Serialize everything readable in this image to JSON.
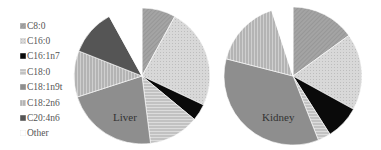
{
  "chart_data": [
    {
      "type": "pie",
      "title": "Liver",
      "categories": [
        "C8:0",
        "C16:0",
        "C16:1n7",
        "C18:0",
        "C18:1n9t",
        "C18:2n6",
        "C20:4n6",
        "Other"
      ],
      "values": [
        8,
        24,
        4,
        12,
        22,
        11,
        11,
        8
      ]
    },
    {
      "type": "pie",
      "title": "Kidney",
      "categories": [
        "C8:0",
        "C16:0",
        "C16:1n7",
        "C18:0",
        "C18:1n9t",
        "C18:2n6",
        "C20:4n6",
        "Other"
      ],
      "values": [
        15,
        18,
        8,
        3,
        35,
        16,
        0,
        5
      ]
    }
  ],
  "legend": {
    "position": "left",
    "items": [
      {
        "label": "C8:0",
        "color": "#9a9a9a",
        "pattern": "diagonal"
      },
      {
        "label": "C16:0",
        "color": "#d4d4d4",
        "pattern": "stipple"
      },
      {
        "label": "C16:1n7",
        "color": "#0a0a0a",
        "pattern": "solid"
      },
      {
        "label": "C18:0",
        "color": "#c8c8c8",
        "pattern": "horizontal"
      },
      {
        "label": "C18:1n9t",
        "color": "#8e8e8e",
        "pattern": "solid"
      },
      {
        "label": "C18:2n6",
        "color": "#b4b4b4",
        "pattern": "vertical"
      },
      {
        "label": "C20:4n6",
        "color": "#555555",
        "pattern": "solid"
      },
      {
        "label": "Other",
        "color": "#ffffff",
        "pattern": "solid"
      }
    ]
  }
}
